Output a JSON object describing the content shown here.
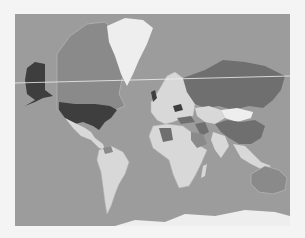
{
  "map": {
    "type": "choropleth",
    "projection": "mercator",
    "colors": {
      "ocean": "#9c9c9c",
      "frame_bg": "#f4f4f4",
      "dark": "#3e3e3e",
      "medium_dark": "#6f6f6f",
      "medium": "#8a8a8a",
      "light": "#d8d8d8",
      "lightest": "#eeeeee",
      "graticule_line": "#f0f0f0"
    },
    "regions": [
      {
        "name": "United States",
        "shade": "dark"
      },
      {
        "name": "Alaska",
        "shade": "dark"
      },
      {
        "name": "Canada",
        "shade": "medium"
      },
      {
        "name": "Greenland",
        "shade": "lightest"
      },
      {
        "name": "Russia",
        "shade": "medium_dark"
      },
      {
        "name": "China",
        "shade": "medium_dark"
      },
      {
        "name": "Mongolia",
        "shade": "light"
      },
      {
        "name": "Kazakhstan",
        "shade": "light"
      },
      {
        "name": "Algeria",
        "shade": "medium_dark"
      },
      {
        "name": "Iran",
        "shade": "medium_dark"
      },
      {
        "name": "Turkey",
        "shade": "medium_dark"
      },
      {
        "name": "Ukraine",
        "shade": "dark"
      },
      {
        "name": "United Kingdom",
        "shade": "dark"
      },
      {
        "name": "Saudi Arabia",
        "shade": "medium"
      },
      {
        "name": "Africa (other)",
        "shade": "light"
      },
      {
        "name": "South America",
        "shade": "light"
      },
      {
        "name": "Mexico",
        "shade": "light"
      },
      {
        "name": "Australia",
        "shade": "medium"
      },
      {
        "name": "India",
        "shade": "light"
      },
      {
        "name": "Europe (other)",
        "shade": "light"
      },
      {
        "name": "Antarctica",
        "shade": "lightest"
      }
    ]
  }
}
